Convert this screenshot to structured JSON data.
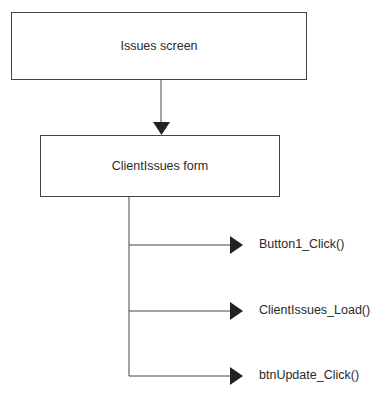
{
  "diagram": {
    "nodes": [
      {
        "id": "issues-screen",
        "label": "Issues screen"
      },
      {
        "id": "clientissues-form",
        "label": "ClientIssues form"
      }
    ],
    "events": [
      {
        "label": "Button1_Click()"
      },
      {
        "label": "ClientIssues_Load()"
      },
      {
        "label": "btnUpdate_Click()"
      }
    ],
    "colors": {
      "line": "#444444",
      "arrow": "#222222",
      "text": "#2a2a2a"
    }
  }
}
